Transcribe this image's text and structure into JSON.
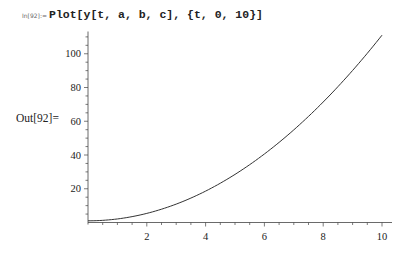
{
  "cell": {
    "input_label": "In[92]:=",
    "input_code": "Plot[y[t, a, b, c], {t, 0, 10}]",
    "output_label": "Out[92]="
  },
  "chart_data": {
    "type": "line",
    "title": "",
    "xlabel": "",
    "ylabel": "",
    "xlim": [
      0,
      10
    ],
    "ylim": [
      0,
      112
    ],
    "x_ticks": [
      2,
      4,
      6,
      8,
      10
    ],
    "y_ticks": [
      20,
      40,
      60,
      80,
      100
    ],
    "grid": false,
    "legend": null,
    "series": [
      {
        "name": "y[t, a, b, c]",
        "x": [
          0,
          1,
          2,
          3,
          4,
          5,
          6,
          7,
          8,
          9,
          10
        ],
        "values": [
          1,
          2.1,
          5.4,
          10.9,
          18.6,
          28.5,
          40.6,
          54.9,
          71.4,
          90.1,
          111
        ]
      }
    ]
  }
}
